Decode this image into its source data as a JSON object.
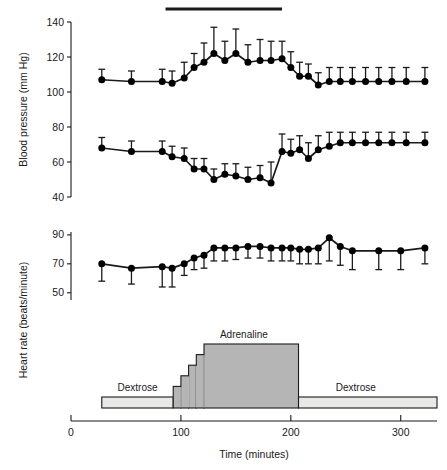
{
  "figure": {
    "background": "#ffffff",
    "ink": "#1a1a1a",
    "marker_color": "#000000",
    "infusion_fill_adrenaline": "#b5b5b5",
    "infusion_fill_dextrose": "#e8e8e6"
  },
  "labels": {
    "y_bp": "Blood pressure (mm Hg)",
    "y_hr": "Heart rate (beats/minute)",
    "x_time": "Time (minutes)",
    "adrenaline": "Adrenaline",
    "dextrose_left": "Dextrose",
    "dextrose_right": "Dextrose"
  },
  "axes": {
    "x": {
      "min": 0,
      "max": 333,
      "ticks": [
        0,
        100,
        200,
        300
      ],
      "ticklabels": [
        "0",
        "100",
        "200",
        "300"
      ]
    },
    "y_bp": {
      "min": 40,
      "max": 140,
      "ticks": [
        40,
        60,
        80,
        100,
        120,
        140
      ],
      "ticklabels": [
        "40",
        "60",
        "80",
        "100",
        "120",
        "140"
      ]
    },
    "y_hr": {
      "min": 45,
      "max": 92,
      "ticks": [
        50,
        70,
        90
      ],
      "ticklabels": [
        "50",
        "70",
        "90"
      ]
    }
  },
  "chart_data": [
    {
      "type": "line",
      "panel": "blood-pressure",
      "title": "",
      "xlabel": "Time (minutes)",
      "ylabel": "Blood pressure (mm Hg)",
      "xlim": [
        0,
        333
      ],
      "ylim": [
        40,
        140
      ],
      "grid": false,
      "legend": "none",
      "error_bars": "upper-only (SD)",
      "x": [
        28,
        55,
        83,
        92,
        103,
        112,
        121,
        130,
        140,
        150,
        161,
        172,
        182,
        192,
        200,
        208,
        216,
        225,
        235,
        245,
        256,
        268,
        280,
        292,
        305,
        322
      ],
      "series": [
        {
          "name": "Systolic blood pressure",
          "values": [
            107,
            106,
            106,
            105,
            108,
            114,
            117,
            122,
            118,
            122,
            117,
            118,
            118,
            119,
            114,
            109,
            109,
            104,
            106,
            106,
            106,
            106,
            106,
            106,
            106,
            106
          ],
          "err_up": [
            6,
            6,
            7,
            7,
            9,
            8,
            11,
            15,
            11,
            14,
            10,
            12,
            11,
            10,
            9,
            8,
            7,
            7,
            8,
            8,
            8,
            8,
            8,
            8,
            8,
            8
          ]
        },
        {
          "name": "Diastolic blood pressure",
          "values": [
            68,
            66,
            66,
            63,
            62,
            56,
            56,
            50,
            53,
            52,
            50,
            51,
            48,
            66,
            65,
            67,
            62,
            67,
            69,
            71,
            71,
            71,
            71,
            71,
            71,
            71
          ],
          "err_up": [
            6,
            6,
            6,
            6,
            6,
            6,
            6,
            6,
            6,
            7,
            7,
            7,
            12,
            10,
            8,
            8,
            9,
            8,
            8,
            6,
            6,
            6,
            6,
            6,
            6,
            6
          ]
        }
      ]
    },
    {
      "type": "line",
      "panel": "heart-rate",
      "title": "",
      "xlabel": "Time (minutes)",
      "ylabel": "Heart rate (beats/minute)",
      "xlim": [
        0,
        333
      ],
      "ylim": [
        45,
        92
      ],
      "grid": false,
      "legend": "none",
      "error_bars": "lower-only (SD)",
      "x": [
        28,
        55,
        83,
        92,
        103,
        112,
        121,
        130,
        140,
        150,
        161,
        172,
        182,
        192,
        200,
        208,
        216,
        225,
        235,
        245,
        256,
        280,
        300,
        322
      ],
      "series": [
        {
          "name": "Heart rate",
          "values": [
            70,
            67,
            68,
            67,
            70,
            74,
            76,
            81,
            81,
            81,
            82,
            82,
            81,
            81,
            81,
            80,
            80,
            81,
            88,
            82,
            79,
            79,
            79,
            81
          ],
          "err_down": [
            12,
            11,
            14,
            13,
            8,
            8,
            9,
            9,
            9,
            8,
            8,
            8,
            9,
            9,
            9,
            10,
            10,
            11,
            16,
            13,
            13,
            13,
            13,
            11
          ]
        }
      ]
    },
    {
      "type": "area",
      "panel": "infusion-schedule",
      "title": "Infusion protocol",
      "xlabel": "Time (minutes)",
      "ylabel": "",
      "xlim": [
        0,
        333
      ],
      "grid": false,
      "legend": "none",
      "segments": [
        {
          "label": "Dextrose",
          "x_start": 28,
          "x_end": 93,
          "level": 0
        },
        {
          "label": "Adrenaline",
          "x_start": 93,
          "x_end": 100,
          "level": 1
        },
        {
          "label": "Adrenaline",
          "x_start": 100,
          "x_end": 107,
          "level": 2
        },
        {
          "label": "Adrenaline",
          "x_start": 107,
          "x_end": 114,
          "level": 3
        },
        {
          "label": "Adrenaline",
          "x_start": 114,
          "x_end": 121,
          "level": 4
        },
        {
          "label": "Adrenaline",
          "x_start": 121,
          "x_end": 207,
          "level": 5
        },
        {
          "label": "Dextrose",
          "x_start": 207,
          "x_end": 333,
          "level": 0
        }
      ]
    }
  ],
  "markers": {
    "treatment_bar": {
      "label": "",
      "x_start": 86,
      "x_end": 192
    }
  }
}
